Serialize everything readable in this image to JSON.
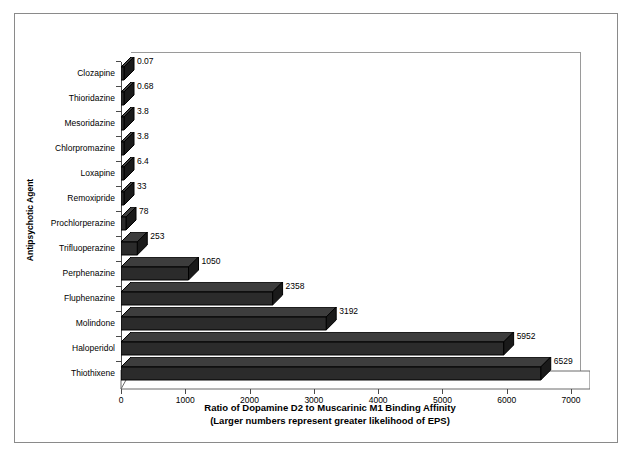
{
  "chart_data": {
    "type": "bar",
    "orientation": "horizontal",
    "title": "",
    "xlabel": "Ratio of Dopamine D2 to Muscarinic M1 Binding Affinity",
    "xlabel_line2": "(Larger numbers represent greater likelihood of EPS)",
    "ylabel": "Antipsychotic Agent",
    "xlim": [
      0,
      7000
    ],
    "xticks": [
      "0",
      "1000",
      "2000",
      "3000",
      "4000",
      "5000",
      "6000",
      "7000"
    ],
    "grid": false,
    "legend": "none",
    "categories": [
      "Clozapine",
      "Thioridazine",
      "Mesoridazine",
      "Chlorpromazine",
      "Loxapine",
      "Remoxipride",
      "Prochlorperazine",
      "Trifluoperazine",
      "Perphenazine",
      "Fluphenazine",
      "Molindone",
      "Haloperidol",
      "Thiothixene"
    ],
    "values": [
      0.07,
      0.68,
      3.8,
      3.8,
      6.4,
      33,
      78,
      253,
      1050,
      2358,
      3192,
      5952,
      6529
    ],
    "value_labels": [
      "0.07",
      "0.68",
      "3.8",
      "3.8",
      "6.4",
      "33",
      "78",
      "253",
      "1050",
      "2358",
      "3192",
      "5952",
      "6529"
    ],
    "bar_color": "#2b2b2b",
    "frame_color": "#8a8a8a"
  }
}
